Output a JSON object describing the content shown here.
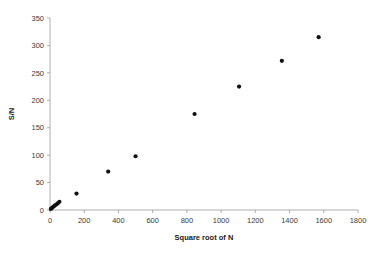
{
  "chart_data": {
    "type": "scatter",
    "title": "",
    "xlabel": "Square root of N",
    "ylabel": "S/N",
    "xlim": [
      0,
      1800
    ],
    "ylim": [
      0,
      350
    ],
    "xticks": [
      0,
      200,
      400,
      600,
      800,
      1000,
      1200,
      1400,
      1600,
      1800
    ],
    "yticks": [
      0,
      50,
      100,
      150,
      200,
      250,
      300,
      350
    ],
    "grid": false,
    "legend": null,
    "marker": "filled-circle",
    "marker_color": "#101010",
    "axis_color": "#9a9a9a",
    "points": [
      {
        "x": 5,
        "y": 2
      },
      {
        "x": 12,
        "y": 4
      },
      {
        "x": 20,
        "y": 6
      },
      {
        "x": 28,
        "y": 8
      },
      {
        "x": 36,
        "y": 10
      },
      {
        "x": 45,
        "y": 12
      },
      {
        "x": 55,
        "y": 15
      },
      {
        "x": 155,
        "y": 30
      },
      {
        "x": 340,
        "y": 70
      },
      {
        "x": 500,
        "y": 98
      },
      {
        "x": 845,
        "y": 175
      },
      {
        "x": 1105,
        "y": 225
      },
      {
        "x": 1355,
        "y": 272
      },
      {
        "x": 1570,
        "y": 315
      }
    ]
  },
  "labels": {
    "x_axis_title": "Square root of N",
    "y_axis_title": "S/N",
    "x_tick_labels": [
      "0",
      "200",
      "400",
      "600",
      "800",
      "1000",
      "1200",
      "1400",
      "1600",
      "1800"
    ],
    "y_tick_labels": [
      "0",
      "50",
      "100",
      "150",
      "200",
      "250",
      "300",
      "350"
    ]
  }
}
